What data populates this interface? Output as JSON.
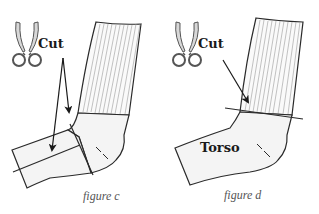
{
  "figures": [
    {
      "id": "c",
      "cut_label": "Cut",
      "caption": "figure c",
      "icon": "scissors-icon"
    },
    {
      "id": "d",
      "cut_label": "Cut",
      "torso_label": "Torso",
      "caption": "figure d",
      "icon": "scissors-icon"
    }
  ],
  "colors": {
    "outline": "#2a2a2a",
    "sock_fill": "#f4f4f4",
    "rib_lines": "#9a9a9a",
    "scissors_fill": "#d8d8d8",
    "caption": "#555555"
  }
}
